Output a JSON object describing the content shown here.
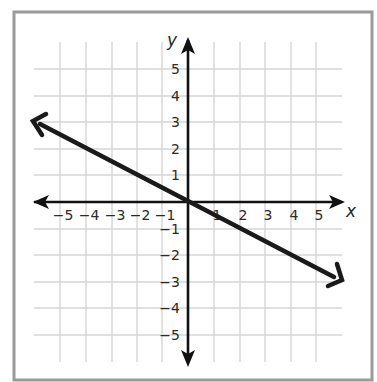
{
  "chart_data": {
    "type": "line",
    "title": "",
    "xlabel": "x",
    "ylabel": "y",
    "xlim": [
      -6,
      6
    ],
    "ylim": [
      -6,
      6
    ],
    "grid": true,
    "x_ticks": [
      "-5",
      "-4",
      "-3",
      "-2",
      "-1",
      "1",
      "2",
      "3",
      "4",
      "5"
    ],
    "y_ticks": [
      "5",
      "4",
      "3",
      "2",
      "1",
      "-1",
      "-2",
      "-3",
      "-4",
      "-5"
    ],
    "series": [
      {
        "name": "line",
        "equation": "y = -0.5x",
        "x": [
          -6,
          0,
          6
        ],
        "y": [
          3,
          0,
          -3
        ],
        "arrows": "both"
      }
    ]
  },
  "labels": {
    "x_axis": "x",
    "y_axis": "y",
    "x_ticks": [
      {
        "text": "−5",
        "x": 60
      },
      {
        "text": "−4",
        "x": 86
      },
      {
        "text": "−3",
        "x": 112
      },
      {
        "text": "−2",
        "x": 137
      },
      {
        "text": "−1",
        "x": 162
      },
      {
        "text": "1",
        "x": 214
      },
      {
        "text": "2",
        "x": 240
      },
      {
        "text": "3",
        "x": 265
      },
      {
        "text": "4",
        "x": 291
      },
      {
        "text": "5",
        "x": 316
      }
    ],
    "y_ticks": [
      {
        "text": "5",
        "y": 69
      },
      {
        "text": "4",
        "y": 96
      },
      {
        "text": "3",
        "y": 122
      },
      {
        "text": "2",
        "y": 149
      },
      {
        "text": "1",
        "y": 175
      },
      {
        "text": "−1",
        "y": 229
      },
      {
        "text": "−2",
        "y": 255
      },
      {
        "text": "−3",
        "y": 282
      },
      {
        "text": "−4",
        "y": 308
      },
      {
        "text": "−5",
        "y": 335
      }
    ]
  },
  "colors": {
    "frame": "#9a9a9a",
    "grid": "#d6d6d6",
    "axis": "#111111",
    "line": "#1a1a1a",
    "text": "#2a2a2a"
  }
}
